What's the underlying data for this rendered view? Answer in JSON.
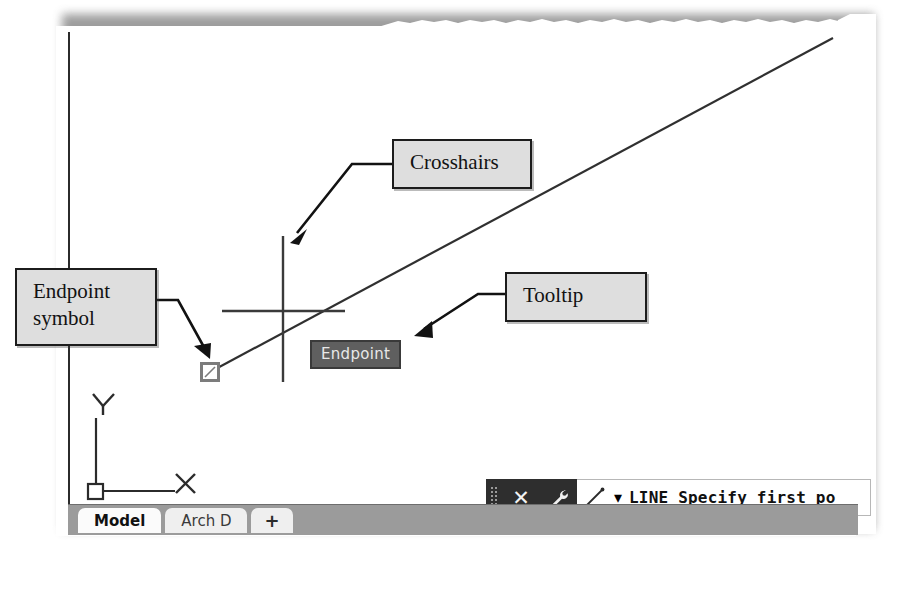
{
  "figure": {
    "type": "scanned-book-figure",
    "application": "AutoCAD drawing area"
  },
  "annotations": [
    {
      "id": "crosshairs",
      "label": "Crosshairs",
      "points_to": "drawing-crosshairs"
    },
    {
      "id": "endpoint-symbol",
      "label": "Endpoint\nsymbol",
      "points_to": "endpoint-snap-marker"
    },
    {
      "id": "tooltip",
      "label": "Tooltip",
      "points_to": "endpoint-tooltip"
    }
  ],
  "drawing": {
    "tooltip_text": "Endpoint",
    "ucs_icon": {
      "x_label": "X",
      "y_label": "Y"
    }
  },
  "command_line": {
    "grip_icon": "grip-dots-icon",
    "close_icon": "✕",
    "close_label": "Close",
    "wrench_icon": "wrench-icon",
    "line_icon": "line-tool-icon",
    "caret_icon": "▾",
    "prompt_command": "LINE",
    "prompt_text": "LINE Specify first po"
  },
  "tabs": [
    {
      "label": "Model",
      "active": true
    },
    {
      "label": "Arch D",
      "active": false
    },
    {
      "label": "+",
      "active": false,
      "is_add": true
    }
  ],
  "colors": {
    "tooltip_bg": "#5f5f5f",
    "tooltip_text": "#e8e8e8",
    "callout_bg": "#dedede",
    "callout_border": "#1c1c1c",
    "statusbar_bg": "#9b9b9b",
    "command_toolbar_bg": "#2e2e2e",
    "snap_marker": "#7c7c7c",
    "geometry_line": "#303030"
  }
}
